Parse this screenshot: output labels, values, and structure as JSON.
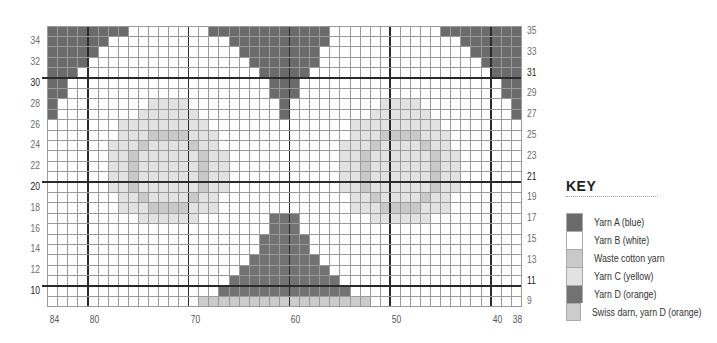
{
  "colors": {
    "yarn_a": "#6b6b6b",
    "yarn_b": "#ffffff",
    "waste": "#c9c9c9",
    "yarn_c": "#e2e2e2",
    "yarn_d": "#727272",
    "swiss": "#cccccc"
  },
  "grid": {
    "left": 47.5,
    "top": 26,
    "cell_w": 10.08,
    "cell_h": 10.4,
    "col_start": 84,
    "col_end": 38,
    "row_start": 35,
    "row_end": 9,
    "thick_cols": [
      80,
      70,
      60,
      50,
      40
    ],
    "thick_rows_bottom": [
      31,
      21,
      11
    ]
  },
  "left_row_labels": [
    "34",
    "32",
    "30",
    "28",
    "26",
    "24",
    "22",
    "20",
    "18",
    "16",
    "14",
    "12",
    "10"
  ],
  "right_row_labels": [
    "35",
    "33",
    "31",
    "29",
    "27",
    "25",
    "23",
    "21",
    "19",
    "17",
    "15",
    "13",
    "11",
    "9"
  ],
  "bold_rows": [
    "30",
    "20",
    "10",
    "31",
    "21",
    "11"
  ],
  "col_labels": [
    "84",
    "80",
    "70",
    "60",
    "50",
    "40",
    "38"
  ],
  "fills": [
    {
      "key": "yarn_a",
      "row": 35,
      "from": 84,
      "to": 77
    },
    {
      "key": "yarn_a",
      "row": 34,
      "from": 84,
      "to": 79
    },
    {
      "key": "yarn_a",
      "row": 33,
      "from": 84,
      "to": 80
    },
    {
      "key": "yarn_a",
      "row": 32,
      "from": 84,
      "to": 81
    },
    {
      "key": "yarn_a",
      "row": 31,
      "from": 84,
      "to": 82
    },
    {
      "key": "yarn_a",
      "row": 30,
      "from": 84,
      "to": 83
    },
    {
      "key": "yarn_a",
      "row": 29,
      "from": 84,
      "to": 83
    },
    {
      "key": "yarn_a",
      "row": 28,
      "from": 84,
      "to": 84
    },
    {
      "key": "yarn_a",
      "row": 27,
      "from": 84,
      "to": 84
    },
    {
      "key": "yarn_a",
      "row": 35,
      "from": 68,
      "to": 57
    },
    {
      "key": "yarn_a",
      "row": 34,
      "from": 66,
      "to": 57
    },
    {
      "key": "yarn_a",
      "row": 33,
      "from": 65,
      "to": 58
    },
    {
      "key": "yarn_a",
      "row": 32,
      "from": 64,
      "to": 58
    },
    {
      "key": "yarn_a",
      "row": 31,
      "from": 63,
      "to": 59
    },
    {
      "key": "yarn_a",
      "row": 30,
      "from": 62,
      "to": 60
    },
    {
      "key": "yarn_a",
      "row": 29,
      "from": 62,
      "to": 60
    },
    {
      "key": "yarn_a",
      "row": 28,
      "from": 61,
      "to": 61
    },
    {
      "key": "yarn_a",
      "row": 27,
      "from": 61,
      "to": 61
    },
    {
      "key": "yarn_a",
      "row": 35,
      "from": 45,
      "to": 38
    },
    {
      "key": "yarn_a",
      "row": 34,
      "from": 43,
      "to": 38
    },
    {
      "key": "yarn_a",
      "row": 33,
      "from": 42,
      "to": 38
    },
    {
      "key": "yarn_a",
      "row": 32,
      "from": 41,
      "to": 38
    },
    {
      "key": "yarn_a",
      "row": 31,
      "from": 40,
      "to": 38
    },
    {
      "key": "yarn_a",
      "row": 30,
      "from": 39,
      "to": 38
    },
    {
      "key": "yarn_a",
      "row": 29,
      "from": 39,
      "to": 38
    },
    {
      "key": "yarn_a",
      "row": 28,
      "from": 38,
      "to": 38
    },
    {
      "key": "yarn_a",
      "row": 27,
      "from": 38,
      "to": 38
    },
    {
      "key": "yarn_c",
      "row": 28,
      "from": 74,
      "to": 71
    },
    {
      "key": "yarn_c",
      "row": 27,
      "from": 75,
      "to": 70
    },
    {
      "key": "yarn_c",
      "row": 26,
      "from": 77,
      "to": 69
    },
    {
      "key": "yarn_c",
      "row": 25,
      "from": 77,
      "to": 68
    },
    {
      "key": "waste",
      "row": 25,
      "from": 74,
      "to": 71
    },
    {
      "key": "yarn_c",
      "row": 24,
      "from": 78,
      "to": 68
    },
    {
      "key": "waste",
      "row": 24,
      "from": 75,
      "to": 75
    },
    {
      "key": "waste",
      "row": 24,
      "from": 70,
      "to": 70
    },
    {
      "key": "yarn_c",
      "row": 23,
      "from": 78,
      "to": 67
    },
    {
      "key": "waste",
      "row": 23,
      "from": 76,
      "to": 76
    },
    {
      "key": "waste",
      "row": 23,
      "from": 69,
      "to": 69
    },
    {
      "key": "yarn_c",
      "row": 22,
      "from": 78,
      "to": 67
    },
    {
      "key": "waste",
      "row": 22,
      "from": 76,
      "to": 76
    },
    {
      "key": "waste",
      "row": 22,
      "from": 69,
      "to": 69
    },
    {
      "key": "yarn_c",
      "row": 21,
      "from": 78,
      "to": 67
    },
    {
      "key": "waste",
      "row": 21,
      "from": 76,
      "to": 76
    },
    {
      "key": "waste",
      "row": 21,
      "from": 69,
      "to": 69
    },
    {
      "key": "yarn_c",
      "row": 20,
      "from": 78,
      "to": 67
    },
    {
      "key": "waste",
      "row": 20,
      "from": 76,
      "to": 76
    },
    {
      "key": "waste",
      "row": 20,
      "from": 69,
      "to": 69
    },
    {
      "key": "yarn_c",
      "row": 19,
      "from": 77,
      "to": 68
    },
    {
      "key": "waste",
      "row": 19,
      "from": 75,
      "to": 75
    },
    {
      "key": "waste",
      "row": 19,
      "from": 70,
      "to": 70
    },
    {
      "key": "yarn_c",
      "row": 18,
      "from": 77,
      "to": 68
    },
    {
      "key": "waste",
      "row": 18,
      "from": 74,
      "to": 71
    },
    {
      "key": "yarn_c",
      "row": 17,
      "from": 75,
      "to": 70
    },
    {
      "key": "yarn_c",
      "row": 28,
      "from": 51,
      "to": 48
    },
    {
      "key": "yarn_c",
      "row": 27,
      "from": 52,
      "to": 47
    },
    {
      "key": "yarn_c",
      "row": 26,
      "from": 54,
      "to": 46
    },
    {
      "key": "yarn_c",
      "row": 25,
      "from": 54,
      "to": 45
    },
    {
      "key": "waste",
      "row": 25,
      "from": 51,
      "to": 48
    },
    {
      "key": "yarn_c",
      "row": 24,
      "from": 55,
      "to": 45
    },
    {
      "key": "waste",
      "row": 24,
      "from": 52,
      "to": 52
    },
    {
      "key": "waste",
      "row": 24,
      "from": 47,
      "to": 47
    },
    {
      "key": "yarn_c",
      "row": 23,
      "from": 55,
      "to": 44
    },
    {
      "key": "waste",
      "row": 23,
      "from": 53,
      "to": 53
    },
    {
      "key": "waste",
      "row": 23,
      "from": 46,
      "to": 46
    },
    {
      "key": "yarn_c",
      "row": 22,
      "from": 55,
      "to": 44
    },
    {
      "key": "waste",
      "row": 22,
      "from": 53,
      "to": 53
    },
    {
      "key": "waste",
      "row": 22,
      "from": 46,
      "to": 46
    },
    {
      "key": "yarn_c",
      "row": 21,
      "from": 55,
      "to": 44
    },
    {
      "key": "waste",
      "row": 21,
      "from": 53,
      "to": 53
    },
    {
      "key": "waste",
      "row": 21,
      "from": 46,
      "to": 46
    },
    {
      "key": "yarn_c",
      "row": 20,
      "from": 55,
      "to": 44
    },
    {
      "key": "waste",
      "row": 20,
      "from": 53,
      "to": 53
    },
    {
      "key": "waste",
      "row": 20,
      "from": 46,
      "to": 46
    },
    {
      "key": "yarn_c",
      "row": 19,
      "from": 54,
      "to": 45
    },
    {
      "key": "waste",
      "row": 19,
      "from": 52,
      "to": 52
    },
    {
      "key": "waste",
      "row": 19,
      "from": 47,
      "to": 47
    },
    {
      "key": "yarn_c",
      "row": 18,
      "from": 54,
      "to": 45
    },
    {
      "key": "waste",
      "row": 18,
      "from": 51,
      "to": 48
    },
    {
      "key": "yarn_c",
      "row": 17,
      "from": 52,
      "to": 47
    },
    {
      "key": "yarn_d",
      "row": 17,
      "from": 62,
      "to": 60
    },
    {
      "key": "yarn_d",
      "row": 16,
      "from": 62,
      "to": 60
    },
    {
      "key": "yarn_d",
      "row": 15,
      "from": 63,
      "to": 59
    },
    {
      "key": "yarn_d",
      "row": 14,
      "from": 63,
      "to": 59
    },
    {
      "key": "yarn_d",
      "row": 13,
      "from": 64,
      "to": 58
    },
    {
      "key": "yarn_d",
      "row": 12,
      "from": 65,
      "to": 57
    },
    {
      "key": "yarn_d",
      "row": 11,
      "from": 66,
      "to": 56
    },
    {
      "key": "yarn_d",
      "row": 10,
      "from": 67,
      "to": 55
    },
    {
      "key": "swiss",
      "row": 9,
      "from": 69,
      "to": 53
    }
  ],
  "key": {
    "title": "KEY",
    "items": [
      {
        "label": "Yarn A (blue)",
        "color_key": "yarn_a"
      },
      {
        "label": "Yarn B (white)",
        "color_key": "yarn_b"
      },
      {
        "label": "Waste cotton yarn",
        "color_key": "waste"
      },
      {
        "label": "Yarn C (yellow)",
        "color_key": "yarn_c"
      },
      {
        "label": "Yarn D (orange)",
        "color_key": "yarn_d"
      },
      {
        "label": "Swiss darn, yarn D (orange)",
        "color_key": "swiss"
      }
    ]
  }
}
